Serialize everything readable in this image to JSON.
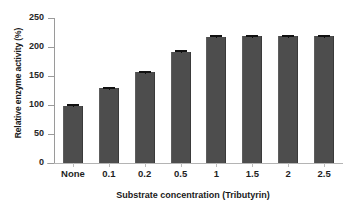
{
  "chart_data": {
    "type": "bar",
    "title": "",
    "xlabel": "Substrate concentration  (Tributyrin)",
    "ylabel": "Relative enzyme activity (%)",
    "categories": [
      "None",
      "0.1",
      "0.2",
      "0.5",
      "1",
      "1.5",
      "2",
      "2.5"
    ],
    "values": [
      99,
      129,
      157,
      192,
      218,
      219,
      219,
      219
    ],
    "errors": [
      2,
      2,
      2,
      2,
      2,
      2,
      2,
      2
    ],
    "ylim": [
      0,
      250
    ],
    "yticks": [
      0,
      50,
      100,
      150,
      200,
      250
    ],
    "ytick_labels": [
      "0",
      "50",
      "100",
      "150",
      "200",
      "250"
    ],
    "grid": false,
    "legend": false,
    "bar_color": "#4d4d4d",
    "axis_color": "#9a9a9a",
    "text_color": "#1a1a1a"
  }
}
